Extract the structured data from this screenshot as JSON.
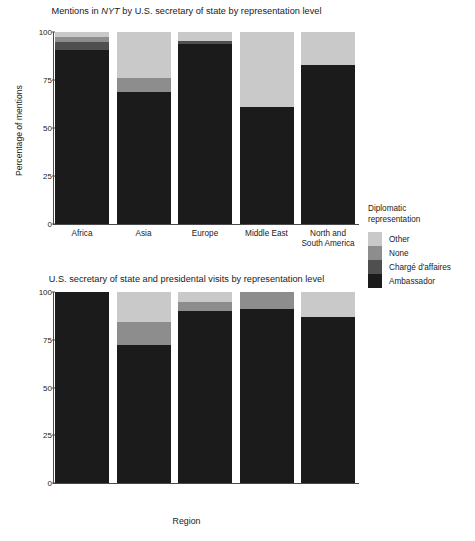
{
  "figure": {
    "xlabel": "Region"
  },
  "legend": {
    "title_line1": "Diplomatic",
    "title_line2": "representation",
    "items": [
      {
        "label": "Other",
        "color": "#c9c9c9"
      },
      {
        "label": "None",
        "color": "#8d8d8d"
      },
      {
        "label": "Chargé d'affaires",
        "color": "#4f4f4f"
      },
      {
        "label": "Ambassador",
        "color": "#1b1b1b"
      }
    ]
  },
  "chart_data": [
    {
      "type": "bar",
      "id": "mentions",
      "stacked": true,
      "normalized_percent": true,
      "title_parts": {
        "before": "Mentions in ",
        "italic": "NYT",
        "after": " by U.S. secretary of state by representation level"
      },
      "title": "Mentions in NYT by U.S. secretary of state by representation level",
      "xlabel": "",
      "ylabel": "Percentage of mentions",
      "ylim": [
        0,
        100
      ],
      "yticks": [
        0,
        25,
        50,
        75,
        100
      ],
      "grid": false,
      "legend_position": "right",
      "categories": [
        "Africa",
        "Asia",
        "Europe",
        "Middle East",
        "North and South America"
      ],
      "category_lines": [
        [
          "Africa"
        ],
        [
          "Asia"
        ],
        [
          "Europe"
        ],
        [
          "Middle East"
        ],
        [
          "North and",
          "South America"
        ]
      ],
      "series": [
        {
          "name": "Ambassador",
          "color": "#1b1b1b",
          "values": [
            90.6,
            68.8,
            93.5,
            60.9,
            82.8
          ]
        },
        {
          "name": "Chargé d'affaires",
          "color": "#4f4f4f",
          "values": [
            4.2,
            0.0,
            1.6,
            0.0,
            0.0
          ]
        },
        {
          "name": "None",
          "color": "#8d8d8d",
          "values": [
            2.6,
            7.3,
            0.0,
            0.0,
            0.0
          ]
        },
        {
          "name": "Other",
          "color": "#c9c9c9",
          "values": [
            2.6,
            23.9,
            4.9,
            39.1,
            17.2
          ]
        }
      ]
    },
    {
      "type": "bar",
      "id": "visits",
      "stacked": true,
      "normalized_percent": true,
      "title_parts": {
        "before": "U.S. secretary of state and presidental visits by representation level",
        "italic": "",
        "after": ""
      },
      "title": "U.S. secretary of state and presidental visits by representation level",
      "xlabel": "Region",
      "ylabel": "Percentage of visits",
      "ylim": [
        0,
        100
      ],
      "yticks": [
        0,
        25,
        50,
        75,
        100
      ],
      "grid": false,
      "legend_position": "right",
      "categories": [
        "Africa",
        "Asia",
        "Europe",
        "Middle East",
        "North and South America"
      ],
      "category_lines": [
        [
          "Africa"
        ],
        [
          "Asia"
        ],
        [
          "Europe"
        ],
        [
          "Middle East"
        ],
        [
          "North and",
          "South America"
        ]
      ],
      "series": [
        {
          "name": "Ambassador",
          "color": "#1b1b1b",
          "values": [
            100.0,
            72.4,
            90.0,
            91.1,
            86.9
          ]
        },
        {
          "name": "Chargé d'affaires",
          "color": "#4f4f4f",
          "values": [
            0.0,
            0.0,
            0.0,
            0.0,
            0.0
          ]
        },
        {
          "name": "None",
          "color": "#8d8d8d",
          "values": [
            0.0,
            12.1,
            4.7,
            8.9,
            0.0
          ]
        },
        {
          "name": "Other",
          "color": "#c9c9c9",
          "values": [
            0.0,
            15.5,
            5.3,
            0.0,
            13.1
          ]
        }
      ]
    }
  ]
}
